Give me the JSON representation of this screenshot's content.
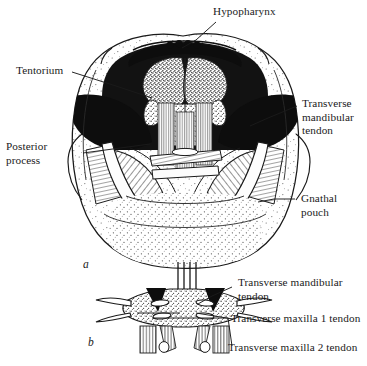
{
  "figure": {
    "caption_letters": {
      "top": "a",
      "bottom": "b"
    },
    "labels": {
      "hypopharynx": "Hypopharynx",
      "tentorium": "Tentorium",
      "posterior_process": "Posterior\nprocess",
      "transverse_mandibular_tendon_a": "Transverse\nmandibular\ntendon",
      "gnathal_pouch": "Gnathal\npouch",
      "transverse_mandibular_tendon_b": "Transverse mandibular\ntendon",
      "transverse_maxilla_1_tendon": "Transverse maxilla 1 tendon",
      "transverse_maxilla_2_tendon": "Transverse maxilla 2 tendon"
    },
    "colors": {
      "ink": "#1a1a1a",
      "background": "#ffffff",
      "solid_black_fill": "#101010",
      "stipple_gray": "#8a8a8a"
    }
  }
}
